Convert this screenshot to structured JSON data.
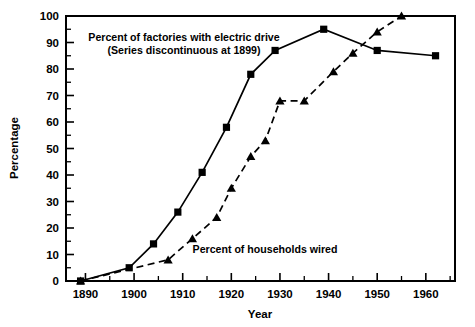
{
  "chart_data": {
    "type": "line",
    "title": "",
    "xlabel": "Year",
    "ylabel": "Percentage",
    "xlim": [
      1886,
      1966
    ],
    "ylim": [
      0,
      100
    ],
    "grid": false,
    "legend_position": "inline-annotations",
    "x_ticks": [
      1890,
      1900,
      1910,
      1920,
      1930,
      1940,
      1950,
      1960
    ],
    "x_tick_labels": [
      "1890",
      "1900",
      "1910",
      "1920",
      "1930",
      "1940",
      "1950",
      "1960"
    ],
    "x_minor_ticks": [
      1895,
      1905,
      1915,
      1925,
      1935,
      1945,
      1955,
      1965
    ],
    "y_ticks": [
      0,
      10,
      20,
      30,
      40,
      50,
      60,
      70,
      80,
      90,
      100
    ],
    "y_tick_labels": [
      "0",
      "10",
      "20",
      "30",
      "40",
      "50",
      "60",
      "70",
      "80",
      "90",
      "100"
    ],
    "y_minor_ticks": [
      5,
      15,
      25,
      35,
      45,
      55,
      65,
      75,
      85,
      95
    ],
    "series": [
      {
        "name": "Percent of factories with electric drive",
        "note": "(Series discontinuous at 1899)",
        "marker": "square",
        "line_style": "solid",
        "color": "#000000",
        "points": [
          {
            "x": 1889,
            "y": 0
          },
          {
            "x": 1899,
            "y": 5
          },
          {
            "x": 1904,
            "y": 14
          },
          {
            "x": 1909,
            "y": 26
          },
          {
            "x": 1914,
            "y": 41
          },
          {
            "x": 1919,
            "y": 58
          },
          {
            "x": 1924,
            "y": 78
          },
          {
            "x": 1929,
            "y": 87
          },
          {
            "x": 1939,
            "y": 95
          },
          {
            "x": 1950,
            "y": 87
          },
          {
            "x": 1962,
            "y": 85
          }
        ]
      },
      {
        "name": "Percent of households wired",
        "note": "",
        "marker": "triangle",
        "line_style": "dashed",
        "color": "#000000",
        "points": [
          {
            "x": 1889,
            "y": 0
          },
          {
            "x": 1907,
            "y": 8
          },
          {
            "x": 1912,
            "y": 16
          },
          {
            "x": 1917,
            "y": 24
          },
          {
            "x": 1920,
            "y": 35
          },
          {
            "x": 1924,
            "y": 47
          },
          {
            "x": 1927,
            "y": 53
          },
          {
            "x": 1930,
            "y": 68
          },
          {
            "x": 1935,
            "y": 68
          },
          {
            "x": 1941,
            "y": 79
          },
          {
            "x": 1945,
            "y": 86
          },
          {
            "x": 1950,
            "y": 94
          },
          {
            "x": 1955,
            "y": 100
          }
        ]
      }
    ],
    "annotations": [
      {
        "id": "factories-annotation",
        "lines": [
          "Percent of factories with electric drive",
          "(Series discontinuous at 1899)"
        ],
        "x_px": 184,
        "y_px": 41
      },
      {
        "id": "households-annotation",
        "lines": [
          "Percent of households wired"
        ],
        "x_px": 265,
        "y_px": 253
      }
    ]
  }
}
